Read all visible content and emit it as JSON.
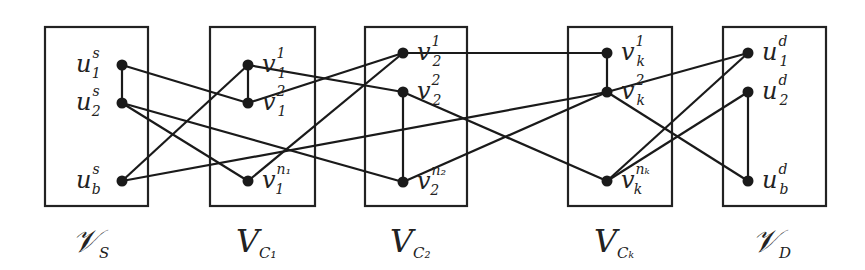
{
  "diagram": {
    "type": "layered-graph",
    "colors": {
      "stroke": "#222222",
      "node": "#1a1a1a",
      "background": "#ffffff"
    },
    "groups": [
      {
        "id": "VS",
        "label_main": "𝒱",
        "label_sub": "S",
        "x": 45,
        "y": 27,
        "w": 103,
        "h": 179,
        "label_x": 72,
        "label_y": 252
      },
      {
        "id": "VC1",
        "label_main": "V",
        "label_sub": "C₁",
        "x": 210,
        "y": 27,
        "w": 105,
        "h": 179,
        "label_x": 236,
        "label_y": 252
      },
      {
        "id": "VC2",
        "label_main": "V",
        "label_sub": "C₂",
        "x": 365,
        "y": 27,
        "w": 102,
        "h": 179,
        "label_x": 390,
        "label_y": 252
      },
      {
        "id": "VCk",
        "label_main": "V",
        "label_sub": "Cₖ",
        "x": 568,
        "y": 27,
        "w": 104,
        "h": 179,
        "label_x": 594,
        "label_y": 252
      },
      {
        "id": "VD",
        "label_main": "𝒱",
        "label_sub": "D",
        "x": 723,
        "y": 27,
        "w": 103,
        "h": 179,
        "label_x": 752,
        "label_y": 252
      }
    ],
    "nodes": [
      {
        "id": "u1s",
        "x": 122,
        "y": 65,
        "base": "u",
        "sup": "s",
        "sub": "1",
        "lx": 76,
        "side": "left"
      },
      {
        "id": "u2s",
        "x": 122,
        "y": 103,
        "base": "u",
        "sup": "s",
        "sub": "2",
        "lx": 76,
        "side": "left"
      },
      {
        "id": "ubs",
        "x": 122,
        "y": 181,
        "base": "u",
        "sup": "s",
        "sub": "b",
        "lx": 76,
        "side": "left"
      },
      {
        "id": "v11",
        "x": 248,
        "y": 65,
        "base": "v",
        "sup": "1",
        "sub": "1",
        "lx": 262,
        "side": "right"
      },
      {
        "id": "v12",
        "x": 248,
        "y": 103,
        "base": "v",
        "sup": "2",
        "sub": "1",
        "lx": 262,
        "side": "right"
      },
      {
        "id": "v1n",
        "x": 248,
        "y": 181,
        "base": "v",
        "sup": "n₁",
        "sub": "1",
        "lx": 262,
        "side": "right"
      },
      {
        "id": "v21",
        "x": 403,
        "y": 53,
        "base": "v",
        "sup": "1",
        "sub": "2",
        "lx": 417,
        "side": "right"
      },
      {
        "id": "v22",
        "x": 403,
        "y": 92,
        "base": "v",
        "sup": "2",
        "sub": "2",
        "lx": 417,
        "side": "right"
      },
      {
        "id": "v2n",
        "x": 403,
        "y": 182,
        "base": "v",
        "sup": "n₂",
        "sub": "2",
        "lx": 417,
        "side": "right"
      },
      {
        "id": "vk1",
        "x": 607,
        "y": 53,
        "base": "v",
        "sup": "1",
        "sub": "k",
        "lx": 621,
        "side": "right"
      },
      {
        "id": "vk2",
        "x": 607,
        "y": 92,
        "base": "v",
        "sup": "2",
        "sub": "k",
        "lx": 621,
        "side": "right"
      },
      {
        "id": "vkn",
        "x": 607,
        "y": 181,
        "base": "v",
        "sup": "nₖ",
        "sub": "k",
        "lx": 621,
        "side": "right"
      },
      {
        "id": "u1d",
        "x": 748,
        "y": 53,
        "base": "u",
        "sup": "d",
        "sub": "1",
        "lx": 762,
        "side": "right"
      },
      {
        "id": "u2d",
        "x": 748,
        "y": 92,
        "base": "u",
        "sup": "d",
        "sub": "2",
        "lx": 762,
        "side": "right"
      },
      {
        "id": "ubd",
        "x": 748,
        "y": 181,
        "base": "u",
        "sup": "d",
        "sub": "b",
        "lx": 762,
        "side": "right"
      }
    ],
    "edges": [
      [
        "u1s",
        "u2s"
      ],
      [
        "u1s",
        "v12"
      ],
      [
        "u2s",
        "v1n"
      ],
      [
        "u2s",
        "v2n"
      ],
      [
        "ubs",
        "v11"
      ],
      [
        "ubs",
        "vk2"
      ],
      [
        "v11",
        "v12"
      ],
      [
        "v11",
        "v22"
      ],
      [
        "v12",
        "v21"
      ],
      [
        "v1n",
        "v21"
      ],
      [
        "v22",
        "v2n"
      ],
      [
        "v21",
        "vk1"
      ],
      [
        "v22",
        "vkn"
      ],
      [
        "v2n",
        "vk2"
      ],
      [
        "vk1",
        "vk2"
      ],
      [
        "vk2",
        "u1d"
      ],
      [
        "vk2",
        "ubd"
      ],
      [
        "vkn",
        "u1d"
      ],
      [
        "vkn",
        "u2d"
      ],
      [
        "u2d",
        "ubd"
      ]
    ]
  }
}
